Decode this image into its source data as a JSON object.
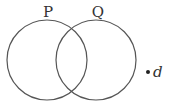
{
  "diagram": {
    "type": "venn",
    "sets": [
      {
        "label": "P",
        "cx": 47,
        "cy": 60,
        "r": 40
      },
      {
        "label": "Q",
        "cx": 96,
        "cy": 60,
        "r": 40
      }
    ],
    "outside_elements": [
      {
        "label": "d",
        "dot_x": 148,
        "dot_y": 72
      }
    ],
    "colors": {
      "stroke": "#555555",
      "text": "#333333",
      "background": "#ffffff"
    }
  }
}
